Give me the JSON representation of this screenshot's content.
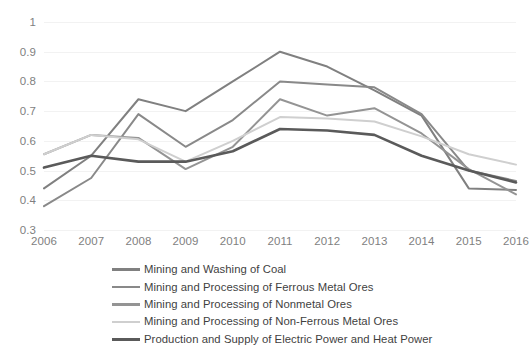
{
  "chart_data": {
    "type": "line",
    "title": "",
    "subtitle": "",
    "xlabel": "",
    "ylabel": "",
    "categories": [
      "2006",
      "2007",
      "2008",
      "2009",
      "2010",
      "2011",
      "2012",
      "2013",
      "2014",
      "2015",
      "2016"
    ],
    "x": [
      2006,
      2007,
      2008,
      2009,
      2010,
      2011,
      2012,
      2013,
      2014,
      2015,
      2016
    ],
    "ylim": [
      0.3,
      1.0
    ],
    "yticks": [
      "0.3",
      "0.4",
      "0.5",
      "0.6",
      "0.7",
      "0.8",
      "0.9",
      "1"
    ],
    "ytick_values": [
      0.3,
      0.4,
      0.5,
      0.6,
      0.7,
      0.8,
      0.9,
      1.0
    ],
    "grid": true,
    "grid_axis": "y",
    "legend_position": "bottom",
    "series": [
      {
        "name": "Mining and Washing of Coal",
        "color": "#808080",
        "values": [
          0.44,
          0.55,
          0.74,
          0.7,
          0.8,
          0.9,
          0.85,
          0.77,
          0.685,
          0.44,
          0.435
        ]
      },
      {
        "name": "Mining and Processing of Ferrous Metal Ores",
        "color": "#898989",
        "values": [
          0.38,
          0.475,
          0.69,
          0.58,
          0.67,
          0.8,
          0.79,
          0.78,
          0.69,
          0.5,
          0.465
        ]
      },
      {
        "name": "Mining and Processing of Nonmetal Ores",
        "color": "#949494",
        "values": [
          0.555,
          0.62,
          0.61,
          0.505,
          0.58,
          0.74,
          0.685,
          0.71,
          0.625,
          0.505,
          0.42
        ]
      },
      {
        "name": "Mining and Processing of Non-Ferrous Metal Ores",
        "color": "#cfcfcf",
        "values": [
          0.555,
          0.62,
          0.605,
          0.53,
          0.6,
          0.68,
          0.675,
          0.665,
          0.615,
          0.555,
          0.52
        ]
      },
      {
        "name": "Production and Supply of Electric Power and Heat Power",
        "color": "#5a5a5a",
        "values": [
          0.51,
          0.55,
          0.53,
          0.53,
          0.565,
          0.64,
          0.635,
          0.62,
          0.55,
          0.5,
          0.46
        ]
      }
    ]
  },
  "axis": {
    "y_tick_color": "#7f7f7f",
    "x_tick_color": "#7f7f7f",
    "gridline_color": "#f2f2f2"
  },
  "legend": {
    "items": [
      {
        "label": "Mining and Washing of Coal",
        "color": "#808080",
        "thickness": 2.6
      },
      {
        "label": "Mining and Processing of Ferrous Metal Ores",
        "color": "#898989",
        "thickness": 2.6
      },
      {
        "label": "Mining and Processing of Nonmetal Ores",
        "color": "#949494",
        "thickness": 2.6
      },
      {
        "label": "Mining and Processing of Non-Ferrous Metal Ores",
        "color": "#cfcfcf",
        "thickness": 2.6
      },
      {
        "label": "Production and Supply of Electric Power and Heat Power",
        "color": "#5a5a5a",
        "thickness": 3.2
      }
    ]
  }
}
